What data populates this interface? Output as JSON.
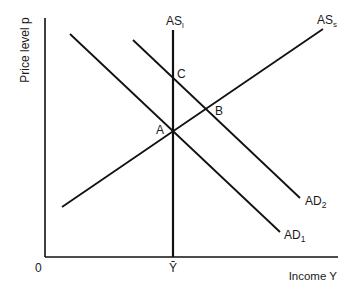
{
  "diagram": {
    "axes": {
      "y_label": "Price level p",
      "x_label": "Income Y",
      "origin_label": "0",
      "x_marker_label": "Ȳ"
    },
    "curves": [
      {
        "id": "AS_l",
        "label": "AS",
        "subscript": "l",
        "type": "vertical"
      },
      {
        "id": "AS_s",
        "label": "AS",
        "subscript": "s",
        "type": "upward"
      },
      {
        "id": "AD_1",
        "label": "AD",
        "subscript": "1",
        "type": "downward"
      },
      {
        "id": "AD_2",
        "label": "AD",
        "subscript": "2",
        "type": "downward"
      }
    ],
    "points": [
      {
        "id": "A",
        "label": "A"
      },
      {
        "id": "B",
        "label": "B"
      },
      {
        "id": "C",
        "label": "C"
      }
    ],
    "colors": {
      "line": "#111111",
      "text": "#1a1a1a",
      "background": "#ffffff"
    }
  }
}
